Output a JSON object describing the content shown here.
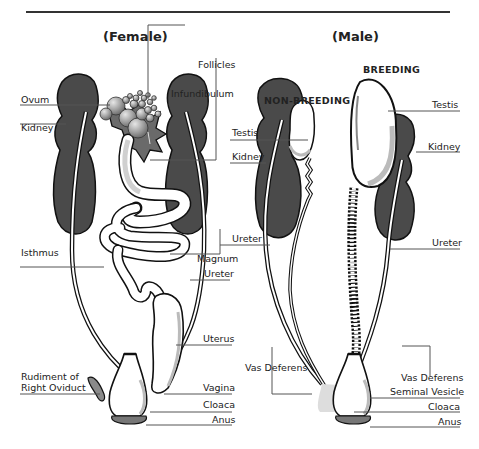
{
  "diagram": {
    "female": {
      "title": "(Female)",
      "labels": {
        "follicles": "Follicles",
        "ovum": "Ovum",
        "infundibulum": "Infundibulum",
        "kidney": "Kidney",
        "isthmus": "Isthmus",
        "magnum": "Magnum",
        "ureter": "Ureter",
        "uterus": "Uterus",
        "rudiment_line1": "Rudiment of",
        "rudiment_line2": "Right Oviduct",
        "vagina": "Vagina",
        "cloaca": "Cloaca",
        "anus": "Anus"
      }
    },
    "male": {
      "title": "(Male)",
      "non_breeding": {
        "heading": "NON-BREEDING",
        "labels": {
          "testis": "Testis",
          "kidney": "Kidney",
          "ureter": "Ureter",
          "vas_deferens": "Vas Deferens"
        }
      },
      "breeding": {
        "heading": "BREEDING",
        "labels": {
          "testis": "Testis",
          "kidney": "Kidney",
          "ureter": "Ureter",
          "vas_deferens": "Vas Deferens",
          "seminal_vesicle": "Seminal Vesicle",
          "cloaca": "Cloaca",
          "anus": "Anus"
        }
      }
    },
    "colors": {
      "kidney": "#4a4a4a",
      "outline": "#111111",
      "shade": "#b8b8b8",
      "ovary": "#9a9a9a",
      "leader": "#555555"
    }
  }
}
